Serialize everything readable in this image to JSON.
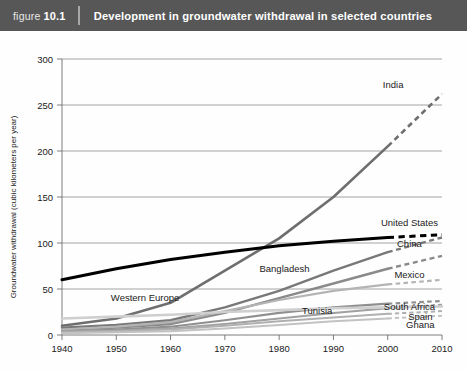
{
  "header": {
    "figure_word": "figure",
    "figure_number": "10.1",
    "title": "Development in groundwater withdrawal in selected countries",
    "bar_color": "#575757"
  },
  "chart_data": {
    "type": "line",
    "title": "Development in groundwater withdrawal in selected countries",
    "xlabel": "",
    "ylabel": "Groundwater withdrawal (cubic kilometers per year)",
    "xlim": [
      1940,
      2010
    ],
    "ylim": [
      0,
      300
    ],
    "x_ticks": [
      1940,
      1950,
      1960,
      1970,
      1980,
      1990,
      2000,
      2010
    ],
    "y_ticks": [
      0,
      50,
      100,
      150,
      200,
      250,
      300
    ],
    "grid": true,
    "legend": "inline-labels",
    "projection_note": "dashed segments denote projected values after 2000",
    "x": [
      1940,
      1950,
      1960,
      1970,
      1980,
      1990,
      2000,
      2010
    ],
    "series": [
      {
        "name": "India",
        "label": "India",
        "color": "#6e6e6e",
        "width": 2.6,
        "values": [
          10,
          18,
          35,
          70,
          105,
          150,
          205,
          262
        ],
        "solid_until": 2000,
        "label_x": 2001,
        "label_y": 272,
        "label_anchor": "middle"
      },
      {
        "name": "United States",
        "label": "United States",
        "color": "#000000",
        "width": 3.0,
        "values": [
          60,
          72,
          82,
          90,
          97,
          102,
          106,
          109
        ],
        "solid_until": 2000,
        "label_x": 2004,
        "label_y": 122,
        "label_anchor": "middle"
      },
      {
        "name": "China",
        "label": "China",
        "color": "#787878",
        "width": 2.4,
        "values": [
          8,
          11,
          16,
          30,
          48,
          70,
          90,
          106
        ],
        "solid_until": 2000,
        "label_x": 2004,
        "label_y": 100,
        "label_anchor": "middle"
      },
      {
        "name": "Bangladesh",
        "label": "Bangladesh",
        "color": "#8a8a8a",
        "width": 2.4,
        "values": [
          6,
          8,
          12,
          24,
          40,
          56,
          72,
          86
        ],
        "solid_until": 2000,
        "label_x": 1981,
        "label_y": 72,
        "label_anchor": "middle"
      },
      {
        "name": "Mexico",
        "label": "Mexico",
        "color": "#b4b4b4",
        "width": 2.2,
        "values": [
          6,
          9,
          14,
          26,
          38,
          48,
          55,
          60
        ],
        "solid_until": 2000,
        "label_x": 2004,
        "label_y": 66,
        "label_anchor": "middle"
      },
      {
        "name": "Tunisia",
        "label": "Tunisia",
        "color": "#8f8f8f",
        "width": 2.2,
        "values": [
          4,
          6,
          9,
          16,
          24,
          30,
          34,
          37
        ],
        "solid_until": 2000,
        "label_x": 1987,
        "label_y": 27,
        "label_anchor": "middle"
      },
      {
        "name": "South Africa",
        "label": "South Africa",
        "color": "#a0a0a0",
        "width": 2.0,
        "values": [
          4,
          5,
          7,
          12,
          18,
          24,
          29,
          33
        ],
        "solid_until": 2000,
        "label_x": 2004,
        "label_y": 31,
        "label_anchor": "middle"
      },
      {
        "name": "Spain",
        "label": "Spain",
        "color": "#b0b0b0",
        "width": 2.0,
        "values": [
          3,
          4,
          6,
          10,
          15,
          19,
          23,
          26
        ],
        "solid_until": 2000,
        "label_x": 2006,
        "label_y": 20,
        "label_anchor": "middle"
      },
      {
        "name": "Ghana",
        "label": "Ghana",
        "color": "#c2c2c2",
        "width": 2.0,
        "values": [
          2,
          3,
          4,
          7,
          11,
          15,
          18,
          21
        ],
        "solid_until": 2000,
        "label_x": 2006,
        "label_y": 11,
        "label_anchor": "middle"
      },
      {
        "name": "Western Europe",
        "label": "Western Europe",
        "color": "#cfcfcf",
        "width": 2.6,
        "values": [
          18,
          20,
          22,
          25,
          27,
          29,
          30,
          31
        ],
        "solid_until": 2010,
        "label_x": 1949,
        "label_y": 41,
        "label_anchor": "start"
      }
    ]
  }
}
